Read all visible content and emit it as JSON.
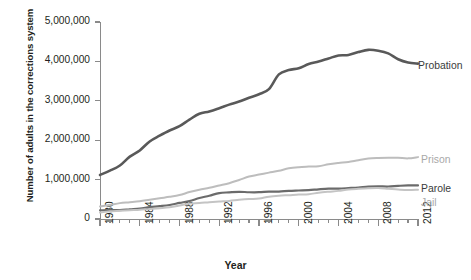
{
  "chart_data": {
    "type": "line",
    "title": "",
    "xlabel": "Year",
    "ylabel": "Number of adults in the corrections system",
    "xlim": [
      1980,
      2012
    ],
    "ylim": [
      0,
      5000000
    ],
    "grid": false,
    "legend_position": "right-inline-labels",
    "ytick_labels": [
      "5,000,000",
      "4,000,000",
      "3,000,000",
      "2,000,000",
      "1,000,000",
      "0"
    ],
    "ytick_values": [
      5000000,
      4000000,
      3000000,
      2000000,
      1000000,
      0
    ],
    "xtick_labels": [
      "1980",
      "1984",
      "1988",
      "1992",
      "1996",
      "2000",
      "2004",
      "2008",
      "2012"
    ],
    "xtick_values": [
      1980,
      1984,
      1988,
      1992,
      1996,
      2000,
      2004,
      2008,
      2012
    ],
    "xtick_minor_step": 1,
    "x": [
      1980,
      1981,
      1982,
      1983,
      1984,
      1985,
      1986,
      1987,
      1988,
      1989,
      1990,
      1991,
      1992,
      1993,
      1994,
      1995,
      1996,
      1997,
      1998,
      1999,
      2000,
      2001,
      2002,
      2003,
      2004,
      2005,
      2006,
      2007,
      2008,
      2009,
      2010,
      2011,
      2012
    ],
    "series": [
      {
        "name": "Probation",
        "color": "#595959",
        "width": 2.6,
        "label_color": "#3b3b3b",
        "values": [
          1118097,
          1225934,
          1357264,
          1582947,
          1740948,
          1968712,
          2114621,
          2247158,
          2356483,
          2522125,
          2670234,
          2728472,
          2811611,
          2903061,
          2981022,
          3077861,
          3164996,
          3296513,
          3670441,
          3779922,
          3826209,
          3931731,
          3995165,
          4073987,
          4151125,
          4162536,
          4236800,
          4293163,
          4270917,
          4203967,
          4055514,
          3971000,
          3942800
        ]
      },
      {
        "name": "Prison",
        "color": "#bdbdbd",
        "width": 2.0,
        "label_color": "#a8a8a8",
        "values": [
          319598,
          360029,
          402914,
          423898,
          448264,
          487593,
          526436,
          562814,
          607766,
          683367,
          743382,
          792535,
          850566,
          909381,
          990147,
          1078542,
          1127528,
          1176564,
          1224469,
          1287172,
          1316333,
          1330007,
          1340311,
          1388215,
          1421345,
          1448344,
          1492973,
          1532851,
          1547742,
          1553574,
          1552669,
          1538847,
          1570400
        ]
      },
      {
        "name": "Parole",
        "color": "#6b6b6b",
        "width": 2.2,
        "label_color": "#3b3b3b",
        "values": [
          220438,
          225539,
          224604,
          246440,
          266992,
          300203,
          325638,
          355505,
          407977,
          456803,
          531407,
          590442,
          658601,
          676100,
          690371,
          679421,
          679733,
          694787,
          696385,
          714457,
          723898,
          732333,
          753141,
          769925,
          771852,
          784408,
          798202,
          821177,
          828169,
          824365,
          840676,
          853852,
          851200
        ]
      },
      {
        "name": "Jail",
        "color": "#c4c4c4",
        "width": 2.0,
        "label_color": "#a8a8a8",
        "values": [
          163994,
          196785,
          209582,
          223551,
          234500,
          256615,
          274444,
          295873,
          341893,
          393303,
          405320,
          426479,
          444584,
          459804,
          486474,
          507044,
          518492,
          567079,
          592462,
          605943,
          621149,
          631240,
          665475,
          691301,
          713990,
          747529,
          765819,
          780174,
          785533,
          767434,
          748728,
          735601,
          744500
        ]
      }
    ],
    "series_labels": [
      {
        "name": "Probation",
        "text": "Probation",
        "tone": "dark",
        "left": 418,
        "top": 60
      },
      {
        "name": "Prison",
        "text": "Prison",
        "tone": "light",
        "left": 421,
        "top": 154
      },
      {
        "name": "Parole",
        "text": "Parole",
        "tone": "dark",
        "left": 421,
        "top": 183
      },
      {
        "name": "Jail",
        "text": "Jail",
        "tone": "light",
        "left": 421,
        "top": 197
      }
    ]
  }
}
